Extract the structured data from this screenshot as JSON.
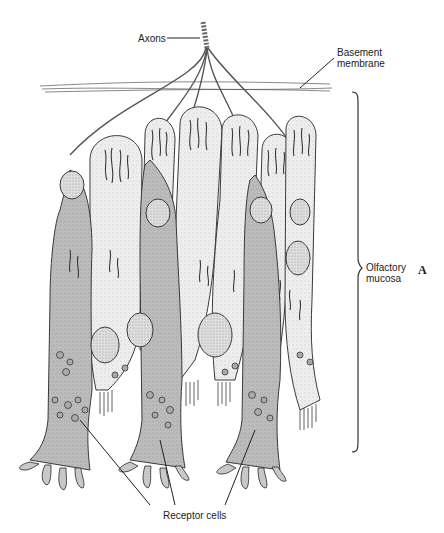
{
  "figure": {
    "panel_letter": "A",
    "labels": {
      "axons": "Axons",
      "basement_membrane_line1": "Basement",
      "basement_membrane_line2": "membrane",
      "olfactory_mucosa_line1": "Olfactory",
      "olfactory_mucosa_line2": "mucosa",
      "receptor_cells": "Receptor cells"
    },
    "colors": {
      "outline": "#3a3a3a",
      "receptor_cell_fill": "#bdbdbd",
      "supporting_cell_fill": "#ececec",
      "nucleus_fill": "#d4d4d4",
      "background": "#ffffff"
    }
  }
}
